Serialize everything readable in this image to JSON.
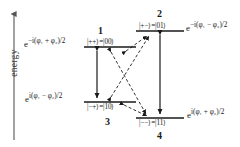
{
  "figure": {
    "type": "energy-level-diagram",
    "title": "",
    "axis": {
      "label": "energy",
      "direction": "up",
      "arrow": true
    },
    "levels": [
      {
        "id": "level-1",
        "number": "1",
        "ket_basis": "|++⟩",
        "ket_computational": "|00⟩",
        "ket_label": "|++⟩=|00⟩",
        "phase_side": "left",
        "phase_base": "e",
        "phase_exponent": "−i(φ₁ + φ₂)/2",
        "phase_text": "e^{−i(φ₁ + φ₂)/2}",
        "x": 84,
        "y": 47,
        "width": 52
      },
      {
        "id": "level-2",
        "number": "2",
        "ket_basis": "|+−⟩",
        "ket_computational": "|01⟩",
        "ket_label": "|+−⟩=|01⟩",
        "phase_side": "right",
        "phase_base": "e",
        "phase_exponent": "−i(φ₁ − φ₂)/2",
        "phase_text": "e^{−i(φ₁ − φ₂)/2}",
        "x": 136,
        "y": 31,
        "width": 48
      },
      {
        "id": "level-3",
        "number": "3",
        "ket_basis": "|−+⟩",
        "ket_computational": "|10⟩",
        "ket_label": "|−+⟩=|10⟩",
        "phase_side": "left",
        "phase_base": "e",
        "phase_exponent": "i(φ₁ − φ₂)/2",
        "phase_text": "e^{i(φ₁ − φ₂)/2}",
        "x": 84,
        "y": 102,
        "width": 52
      },
      {
        "id": "level-4",
        "number": "4",
        "ket_basis": "|−−⟩",
        "ket_computational": "|11⟩",
        "ket_label": "|−−⟩=|11⟩",
        "phase_side": "right",
        "phase_base": "e",
        "phase_exponent": "i(φ₁ + φ₂)/2",
        "phase_text": "e^{i(φ₁ + φ₂)/2}",
        "x": 136,
        "y": 118,
        "width": 48
      }
    ],
    "transitions": [
      {
        "id": "t-1-3",
        "from": "1",
        "to": "3",
        "style": "solid",
        "arrowheads": "both"
      },
      {
        "id": "t-2-4",
        "from": "2",
        "to": "4",
        "style": "solid",
        "arrowheads": "both"
      },
      {
        "id": "t-1-2",
        "from": "1",
        "to": "2",
        "style": "dashed",
        "arrowheads": "both"
      },
      {
        "id": "t-1-4",
        "from": "1",
        "to": "4",
        "style": "dashed",
        "arrowheads": "both"
      },
      {
        "id": "t-3-2",
        "from": "3",
        "to": "2",
        "style": "dashed",
        "arrowheads": "both"
      },
      {
        "id": "t-3-4",
        "from": "3",
        "to": "4",
        "style": "dashed",
        "arrowheads": "both"
      }
    ],
    "colors": {
      "ink": "#1a1a1a",
      "axis": "#555555",
      "background": "#ffffff"
    }
  },
  "labels": {
    "axis_energy": "energy",
    "num1": "1",
    "num2": "2",
    "num3": "3",
    "num4": "4",
    "ket1": "|++⟩=|00⟩",
    "ket2": "|+−⟩=|01⟩",
    "ket3": "|−+⟩=|10⟩",
    "ket4": "|−−⟩=|11⟩",
    "phase1_pre": "e",
    "phase1_exp": "−i(φ₁ + φ₂)/2",
    "phase2_pre": "e",
    "phase2_exp": "−i(φ₁ − φ₂)/2",
    "phase3_pre": "e",
    "phase3_exp": "i(φ₁ − φ₂)/2",
    "phase4_pre": "e",
    "phase4_exp": "i(φ₁ + φ₂)/2"
  }
}
